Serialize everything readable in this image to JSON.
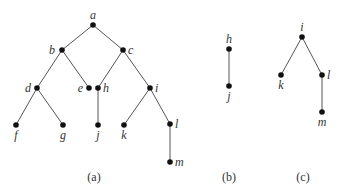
{
  "figure": {
    "panels": [
      {
        "caption": "(a)",
        "caption_pos": [
          94,
          181
        ],
        "nodes": [
          {
            "id": "a",
            "x": 93,
            "y": 25,
            "lx": 93,
            "ly": 19,
            "anchor": "middle"
          },
          {
            "id": "b",
            "x": 62,
            "y": 50,
            "lx": 55,
            "ly": 54,
            "anchor": "end"
          },
          {
            "id": "c",
            "x": 123,
            "y": 50,
            "lx": 128,
            "ly": 54,
            "anchor": "start"
          },
          {
            "id": "d",
            "x": 37,
            "y": 88,
            "lx": 31,
            "ly": 92,
            "anchor": "end"
          },
          {
            "id": "e",
            "x": 89,
            "y": 88,
            "lx": 83,
            "ly": 92,
            "anchor": "end"
          },
          {
            "id": "h",
            "x": 98,
            "y": 88,
            "lx": 103,
            "ly": 92,
            "anchor": "start"
          },
          {
            "id": "i",
            "x": 150,
            "y": 88,
            "lx": 155,
            "ly": 92,
            "anchor": "start"
          },
          {
            "id": "f",
            "x": 16,
            "y": 125,
            "lx": 16,
            "ly": 139,
            "anchor": "middle"
          },
          {
            "id": "g",
            "x": 63,
            "y": 125,
            "lx": 63,
            "ly": 139,
            "anchor": "middle"
          },
          {
            "id": "j",
            "x": 98,
            "y": 125,
            "lx": 98,
            "ly": 139,
            "anchor": "middle"
          },
          {
            "id": "k",
            "x": 124,
            "y": 125,
            "lx": 124,
            "ly": 139,
            "anchor": "middle"
          },
          {
            "id": "l",
            "x": 170,
            "y": 124,
            "lx": 175,
            "ly": 128,
            "anchor": "start"
          },
          {
            "id": "m",
            "x": 170,
            "y": 162,
            "lx": 175,
            "ly": 166,
            "anchor": "start"
          }
        ],
        "edges": [
          [
            "a",
            "b"
          ],
          [
            "a",
            "c"
          ],
          [
            "b",
            "d"
          ],
          [
            "b",
            "e"
          ],
          [
            "c",
            "h"
          ],
          [
            "c",
            "i"
          ],
          [
            "d",
            "f"
          ],
          [
            "d",
            "g"
          ],
          [
            "h",
            "j"
          ],
          [
            "i",
            "k"
          ],
          [
            "i",
            "l"
          ],
          [
            "l",
            "m"
          ]
        ]
      },
      {
        "caption": "(b)",
        "caption_pos": [
          229,
          181
        ],
        "nodes": [
          {
            "id": "h",
            "x": 229,
            "y": 49,
            "lx": 229,
            "ly": 43,
            "anchor": "middle"
          },
          {
            "id": "j",
            "x": 229,
            "y": 86,
            "lx": 229,
            "ly": 100,
            "anchor": "middle"
          }
        ],
        "edges": [
          [
            "h",
            "j"
          ]
        ]
      },
      {
        "caption": "(c)",
        "caption_pos": [
          303,
          181
        ],
        "nodes": [
          {
            "id": "i",
            "x": 302,
            "y": 37,
            "lx": 302,
            "ly": 31,
            "anchor": "middle"
          },
          {
            "id": "k",
            "x": 281,
            "y": 75,
            "lx": 281,
            "ly": 89,
            "anchor": "middle"
          },
          {
            "id": "l",
            "x": 322,
            "y": 75,
            "lx": 327,
            "ly": 79,
            "anchor": "start"
          },
          {
            "id": "m",
            "x": 322,
            "y": 112,
            "lx": 322,
            "ly": 126,
            "anchor": "middle"
          }
        ],
        "edges": [
          [
            "i",
            "k"
          ],
          [
            "i",
            "l"
          ],
          [
            "l",
            "m"
          ]
        ]
      }
    ]
  }
}
